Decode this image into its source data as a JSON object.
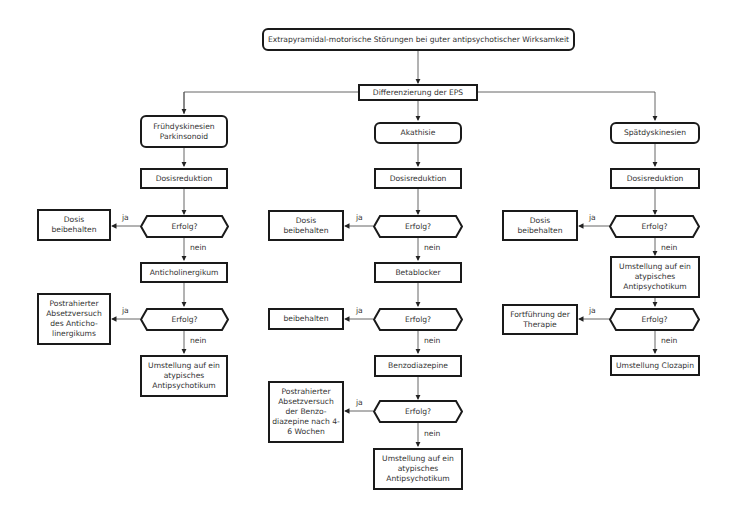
{
  "diagram": {
    "root": "Extrapyramidal-motorische Störungen bei guter antipsychotischer Wirksamkeit",
    "differentiation": "Differenzierung der EPS",
    "yes_label": "ja",
    "no_label": "nein",
    "decision_label": "Erfolg?",
    "branches": [
      {
        "title": "Frühdyskinesien Parkinsonoid",
        "step1": "Dosisreduktion",
        "yes1": "Dosis beibehalten",
        "step2": "Anticholinergikum",
        "yes2": "Postrahierter Absetzversuch des Anticho- linergikums",
        "final": "Umstellung auf ein atypisches Antipsychotikum"
      },
      {
        "title": "Akathisie",
        "step1": "Dosisreduktion",
        "yes1": "Dosis beibehalten",
        "step2": "Betablocker",
        "yes2": "beibehalten",
        "step3": "Benzodiazepine",
        "yes3": "Postrahierter Absetzversuch der Benzo- diazepine nach 4-6 Wochen",
        "final": "Umstellung auf ein atypisches Antipsychotikum"
      },
      {
        "title": "Spätdyskinesien",
        "step1": "Dosisreduktion",
        "yes1": "Dosis beibehalten",
        "step2": "Umstellung auf ein atypisches Antipsychotikum",
        "yes2": "Fortführung der Therapie",
        "final": "Umstellung Clozapin"
      }
    ]
  }
}
